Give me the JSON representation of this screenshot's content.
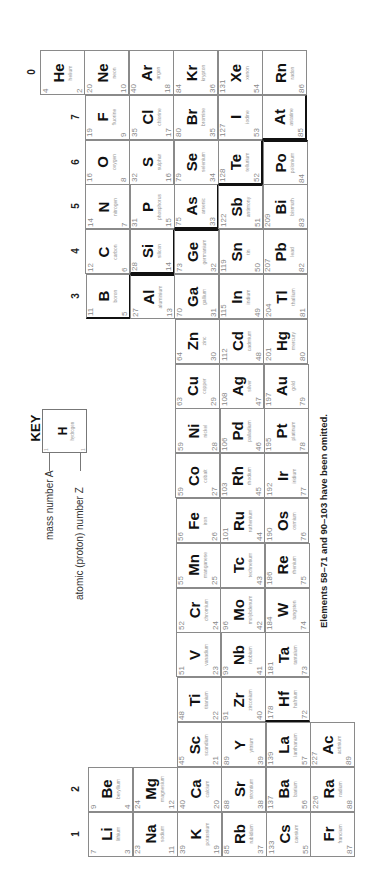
{
  "group_labels": [
    {
      "label": "0",
      "x": 22,
      "y": 62
    },
    {
      "label": "7",
      "x": 66,
      "y": 107
    },
    {
      "label": "6",
      "x": 66,
      "y": 152
    },
    {
      "label": "5",
      "x": 66,
      "y": 196
    },
    {
      "label": "4",
      "x": 66,
      "y": 241
    },
    {
      "label": "3",
      "x": 66,
      "y": 286
    },
    {
      "label": "2",
      "x": 66,
      "y": 779
    },
    {
      "label": "1",
      "x": 66,
      "y": 824
    }
  ],
  "key": {
    "title": "KEY",
    "example": {
      "symbol": "H",
      "name": "hydrogen",
      "mass": "1",
      "number": "1"
    },
    "mass_label": "mass number A",
    "atomic_label": "atomic (proton) number Z"
  },
  "footnote": "Elements 58–71 and 90–103 have been omitted.",
  "elements": [
    {
      "sym": "He",
      "name": "helium",
      "mass": "4",
      "num": "2",
      "row": 0,
      "period": 1
    },
    {
      "sym": "Ne",
      "name": "neon",
      "mass": "20",
      "num": "10",
      "row": 0,
      "period": 2
    },
    {
      "sym": "Ar",
      "name": "argon",
      "mass": "40",
      "num": "18",
      "row": 0,
      "period": 3
    },
    {
      "sym": "Kr",
      "name": "krypton",
      "mass": "84",
      "num": "36",
      "row": 0,
      "period": 4
    },
    {
      "sym": "Xe",
      "name": "xenon",
      "mass": "131",
      "num": "54",
      "row": 0,
      "period": 5
    },
    {
      "sym": "Rn",
      "name": "radon",
      "mass": "",
      "num": "86",
      "row": 0,
      "period": 6
    },
    {
      "sym": "F",
      "name": "fluorine",
      "mass": "19",
      "num": "9",
      "row": 1,
      "period": 2
    },
    {
      "sym": "Cl",
      "name": "chlorine",
      "mass": "35",
      "num": "17",
      "row": 1,
      "period": 3
    },
    {
      "sym": "Br",
      "name": "bromine",
      "mass": "80",
      "num": "35",
      "row": 1,
      "period": 4
    },
    {
      "sym": "I",
      "name": "iodine",
      "mass": "127",
      "num": "53",
      "row": 1,
      "period": 5
    },
    {
      "sym": "At",
      "name": "astatine",
      "mass": "",
      "num": "85",
      "row": 1,
      "period": 6,
      "thick": "right bottom"
    },
    {
      "sym": "O",
      "name": "oxygen",
      "mass": "16",
      "num": "8",
      "row": 2,
      "period": 2
    },
    {
      "sym": "S",
      "name": "sulphur",
      "mass": "32",
      "num": "16",
      "row": 2,
      "period": 3
    },
    {
      "sym": "Se",
      "name": "selenium",
      "mass": "79",
      "num": "34",
      "row": 2,
      "period": 4
    },
    {
      "sym": "Te",
      "name": "tellurium",
      "mass": "128",
      "num": "52",
      "row": 2,
      "period": 5,
      "thick": "right bottom"
    },
    {
      "sym": "Po",
      "name": "polonium",
      "mass": "",
      "num": "84",
      "row": 2,
      "period": 6,
      "thick": "top"
    },
    {
      "sym": "N",
      "name": "nitrogen",
      "mass": "14",
      "num": "7",
      "row": 3,
      "period": 2
    },
    {
      "sym": "P",
      "name": "phosphorus",
      "mass": "31",
      "num": "15",
      "row": 3,
      "period": 3
    },
    {
      "sym": "As",
      "name": "arsenic",
      "mass": "75",
      "num": "33",
      "row": 3,
      "period": 4,
      "thick": "right bottom"
    },
    {
      "sym": "Sb",
      "name": "antimony",
      "mass": "122",
      "num": "51",
      "row": 3,
      "period": 5,
      "thick": "top"
    },
    {
      "sym": "Bi",
      "name": "bismuth",
      "mass": "209",
      "num": "83",
      "row": 3,
      "period": 6
    },
    {
      "sym": "C",
      "name": "carbon",
      "mass": "12",
      "num": "6",
      "row": 4,
      "period": 2
    },
    {
      "sym": "Si",
      "name": "silicon",
      "mass": "28",
      "num": "14",
      "row": 4,
      "period": 3,
      "thick": "right bottom"
    },
    {
      "sym": "Ge",
      "name": "germanium",
      "mass": "73",
      "num": "32",
      "row": 4,
      "period": 4,
      "thick": "top"
    },
    {
      "sym": "Sn",
      "name": "tin",
      "mass": "119",
      "num": "50",
      "row": 4,
      "period": 5
    },
    {
      "sym": "Pb",
      "name": "lead",
      "mass": "207",
      "num": "82",
      "row": 4,
      "period": 6
    },
    {
      "sym": "B",
      "name": "boron",
      "mass": "11",
      "num": "5",
      "row": 5,
      "period": 2,
      "thick": "right bottom"
    },
    {
      "sym": "Al",
      "name": "aluminium",
      "mass": "27",
      "num": "13",
      "row": 5,
      "period": 3,
      "thick": "top"
    },
    {
      "sym": "Ga",
      "name": "gallium",
      "mass": "70",
      "num": "31",
      "row": 5,
      "period": 4
    },
    {
      "sym": "In",
      "name": "indium",
      "mass": "115",
      "num": "49",
      "row": 5,
      "period": 5
    },
    {
      "sym": "Tl",
      "name": "thallium",
      "mass": "204",
      "num": "81",
      "row": 5,
      "period": 6
    },
    {
      "sym": "Zn",
      "name": "zinc",
      "mass": "64",
      "num": "30",
      "row": 6,
      "period": 4
    },
    {
      "sym": "Cd",
      "name": "cadmium",
      "mass": "112",
      "num": "48",
      "row": 6,
      "period": 5
    },
    {
      "sym": "Hg",
      "name": "mercury",
      "mass": "201",
      "num": "80",
      "row": 6,
      "period": 6
    },
    {
      "sym": "Cu",
      "name": "copper",
      "mass": "63",
      "num": "29",
      "row": 7,
      "period": 4
    },
    {
      "sym": "Ag",
      "name": "silver",
      "mass": "108",
      "num": "47",
      "row": 7,
      "period": 5
    },
    {
      "sym": "Au",
      "name": "gold",
      "mass": "197",
      "num": "79",
      "row": 7,
      "period": 6
    },
    {
      "sym": "Ni",
      "name": "nickel",
      "mass": "59",
      "num": "28",
      "row": 8,
      "period": 4
    },
    {
      "sym": "Pd",
      "name": "palladium",
      "mass": "106",
      "num": "46",
      "row": 8,
      "period": 5
    },
    {
      "sym": "Pt",
      "name": "platinum",
      "mass": "195",
      "num": "78",
      "row": 8,
      "period": 6
    },
    {
      "sym": "Co",
      "name": "cobalt",
      "mass": "59",
      "num": "27",
      "row": 9,
      "period": 4
    },
    {
      "sym": "Rh",
      "name": "rhodium",
      "mass": "103",
      "num": "45",
      "row": 9,
      "period": 5
    },
    {
      "sym": "Ir",
      "name": "iridium",
      "mass": "192",
      "num": "77",
      "row": 9,
      "period": 6
    },
    {
      "sym": "Fe",
      "name": "iron",
      "mass": "56",
      "num": "26",
      "row": 10,
      "period": 4
    },
    {
      "sym": "Ru",
      "name": "ruthenium",
      "mass": "101",
      "num": "44",
      "row": 10,
      "period": 5
    },
    {
      "sym": "Os",
      "name": "osmium",
      "mass": "190",
      "num": "76",
      "row": 10,
      "period": 6
    },
    {
      "sym": "Mn",
      "name": "manganese",
      "mass": "55",
      "num": "25",
      "row": 11,
      "period": 4
    },
    {
      "sym": "Tc",
      "name": "technetium",
      "mass": "",
      "num": "43",
      "row": 11,
      "period": 5
    },
    {
      "sym": "Re",
      "name": "rhenium",
      "mass": "186",
      "num": "75",
      "row": 11,
      "period": 6
    },
    {
      "sym": "Cr",
      "name": "chromium",
      "mass": "52",
      "num": "24",
      "row": 12,
      "period": 4
    },
    {
      "sym": "Mo",
      "name": "molybdenum",
      "mass": "96",
      "num": "42",
      "row": 12,
      "period": 5
    },
    {
      "sym": "W",
      "name": "tungsten",
      "mass": "184",
      "num": "74",
      "row": 12,
      "period": 6
    },
    {
      "sym": "V",
      "name": "vanadium",
      "mass": "51",
      "num": "23",
      "row": 13,
      "period": 4
    },
    {
      "sym": "Nb",
      "name": "niobium",
      "mass": "93",
      "num": "41",
      "row": 13,
      "period": 5
    },
    {
      "sym": "Ta",
      "name": "tantalum",
      "mass": "181",
      "num": "73",
      "row": 13,
      "period": 6
    },
    {
      "sym": "Ti",
      "name": "titanium",
      "mass": "48",
      "num": "22",
      "row": 14,
      "period": 4
    },
    {
      "sym": "Zr",
      "name": "zirconium",
      "mass": "91",
      "num": "40",
      "row": 14,
      "period": 5
    },
    {
      "sym": "Hf",
      "name": "hafnium",
      "mass": "178",
      "num": "72",
      "row": 14,
      "period": 6,
      "thick": "bottom"
    },
    {
      "sym": "Sc",
      "name": "scandium",
      "mass": "45",
      "num": "21",
      "row": 15,
      "period": 4
    },
    {
      "sym": "Y",
      "name": "yttrium",
      "mass": "89",
      "num": "39",
      "row": 15,
      "period": 5
    },
    {
      "sym": "La",
      "name": "lanthanum",
      "mass": "139",
      "num": "57",
      "row": 15,
      "period": 6
    },
    {
      "sym": "Ac",
      "name": "actinium",
      "mass": "227",
      "num": "89",
      "row": 15,
      "period": 7
    },
    {
      "sym": "Be",
      "name": "beryllium",
      "mass": "9",
      "num": "4",
      "row": 16,
      "period": 2
    },
    {
      "sym": "Mg",
      "name": "magnesium",
      "mass": "24",
      "num": "12",
      "row": 16,
      "period": 3
    },
    {
      "sym": "Ca",
      "name": "calcium",
      "mass": "40",
      "num": "20",
      "row": 16,
      "period": 4
    },
    {
      "sym": "Sr",
      "name": "strontium",
      "mass": "88",
      "num": "38",
      "row": 16,
      "period": 5
    },
    {
      "sym": "Ba",
      "name": "barium",
      "mass": "137",
      "num": "56",
      "row": 16,
      "period": 6
    },
    {
      "sym": "Ra",
      "name": "radium",
      "mass": "226",
      "num": "88",
      "row": 16,
      "period": 7
    },
    {
      "sym": "Li",
      "name": "lithium",
      "mass": "7",
      "num": "3",
      "row": 17,
      "period": 2
    },
    {
      "sym": "Na",
      "name": "sodium",
      "mass": "23",
      "num": "11",
      "row": 17,
      "period": 3
    },
    {
      "sym": "K",
      "name": "potassium",
      "mass": "39",
      "num": "19",
      "row": 17,
      "period": 4
    },
    {
      "sym": "Rb",
      "name": "rubidium",
      "mass": "85",
      "num": "37",
      "row": 17,
      "period": 5
    },
    {
      "sym": "Cs",
      "name": "caesium",
      "mass": "133",
      "num": "55",
      "row": 17,
      "period": 6
    },
    {
      "sym": "Fr",
      "name": "francium",
      "mass": "",
      "num": "87",
      "row": 17,
      "period": 7
    }
  ]
}
